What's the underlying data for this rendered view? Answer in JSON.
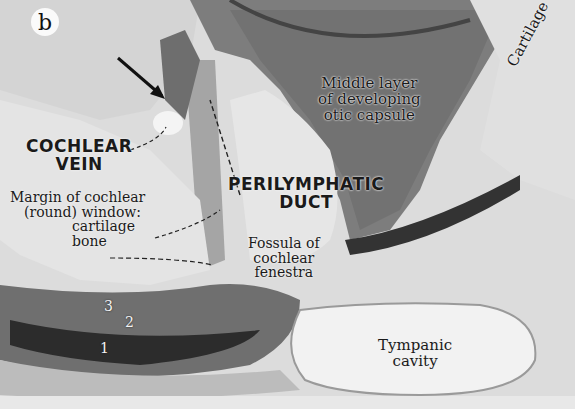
{
  "figure": {
    "panel_letter": "b",
    "labels": {
      "cochlear_vein": [
        "COCHLEAR",
        "VEIN"
      ],
      "perilymphatic_duct": [
        "PERILYMPHATIC",
        "DUCT"
      ],
      "middle_layer": [
        "Middle layer",
        "of developing",
        "otic capsule"
      ],
      "cartilage": "Cartilage",
      "margin_window": [
        "Margin of cochlear",
        "(round) window:",
        "cartilage",
        "bone"
      ],
      "fossula": [
        "Fossula of",
        "cochlear",
        "fenestra"
      ],
      "tympanic_cavity": [
        "Tympanic",
        "cavity"
      ]
    },
    "layer_numbers": [
      "3",
      "2",
      "1"
    ]
  }
}
